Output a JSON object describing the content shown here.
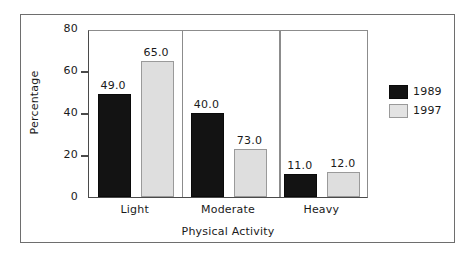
{
  "chart_data": {
    "type": "bar",
    "title": "",
    "subtitle": "",
    "xlabel": "Physical Activity",
    "ylabel": "Percentage",
    "categories": [
      "Light",
      "Moderate",
      "Heavy"
    ],
    "series": [
      {
        "name": "1989",
        "color": "#131313",
        "values": [
          49.0,
          40.0,
          11.0
        ],
        "labels": [
          "49.0",
          "40.0",
          "11.0"
        ],
        "plotted_heights": [
          49.0,
          40.0,
          11.0
        ]
      },
      {
        "name": "1997",
        "color": "#dedede",
        "values": [
          65.0,
          73.0,
          12.0
        ],
        "labels": [
          "65.0",
          "73.0",
          "12.0"
        ],
        "plotted_heights": [
          65.0,
          23.0,
          12.0
        ]
      }
    ],
    "ylim": [
      0,
      80
    ],
    "yticks": [
      0,
      20,
      40,
      60,
      80
    ],
    "ytick_labels": [
      "0",
      "20",
      "40",
      "60",
      "80"
    ],
    "grid": false,
    "legend_position": "right",
    "legend_entries": [
      "1989",
      "1997"
    ],
    "group_separators": true,
    "annotations": []
  },
  "figure": {
    "frame_visible": true,
    "background_color": "#ffffff",
    "axis_color": "#4a4a4a",
    "frame_color": "#6e6e6e"
  }
}
